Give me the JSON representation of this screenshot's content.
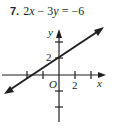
{
  "problem": {
    "number": "7.",
    "equation_parts": [
      "2",
      "x",
      " − 3",
      "y",
      " = −6"
    ]
  },
  "graph": {
    "x_axis_label": "x",
    "y_axis_label": "y",
    "origin_label": "O",
    "x_tick_label": "2",
    "y_tick_label": "2",
    "line_color": "#231f20"
  }
}
